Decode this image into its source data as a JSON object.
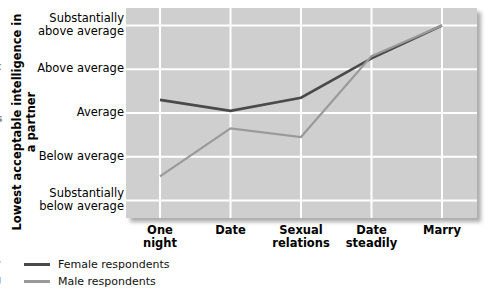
{
  "figure": {
    "y_axis_title": "Lowest acceptable intelligence in a partner",
    "bleed_left": {
      "fragment_top": "t",
      "fragment_mid": "s",
      "legend_frag_1": "y",
      "legend_frag_2": "g"
    }
  },
  "legend": {
    "items": [
      {
        "label": "Female respondents",
        "color": "#4a4a4a",
        "icon": "line-swatch-icon"
      },
      {
        "label": "Male respondents",
        "color": "#9a9a9a",
        "icon": "line-swatch-icon"
      }
    ]
  },
  "chart_data": {
    "type": "line",
    "title": "",
    "xlabel": "",
    "ylabel": "Lowest acceptable intelligence in a partner",
    "categories": [
      "One night",
      "Date",
      "Sexual relations",
      "Date steadily",
      "Marry"
    ],
    "ytick_labels": [
      "Substantially above average",
      "Above average",
      "Average",
      "Below average",
      "Substantially below average"
    ],
    "ytick_values": [
      5,
      4,
      3,
      2,
      1
    ],
    "ylim": [
      0.6,
      5.4
    ],
    "grid": true,
    "legend_position": "below-left",
    "plot_background": "#cfcfcf",
    "grid_color": "#ffffff",
    "series": [
      {
        "name": "Female respondents",
        "color": "#4a4a4a",
        "values": [
          3.3,
          3.05,
          3.35,
          4.25,
          5.0
        ]
      },
      {
        "name": "Male respondents",
        "color": "#9a9a9a",
        "values": [
          1.55,
          2.65,
          2.45,
          4.3,
          5.0
        ]
      }
    ]
  }
}
